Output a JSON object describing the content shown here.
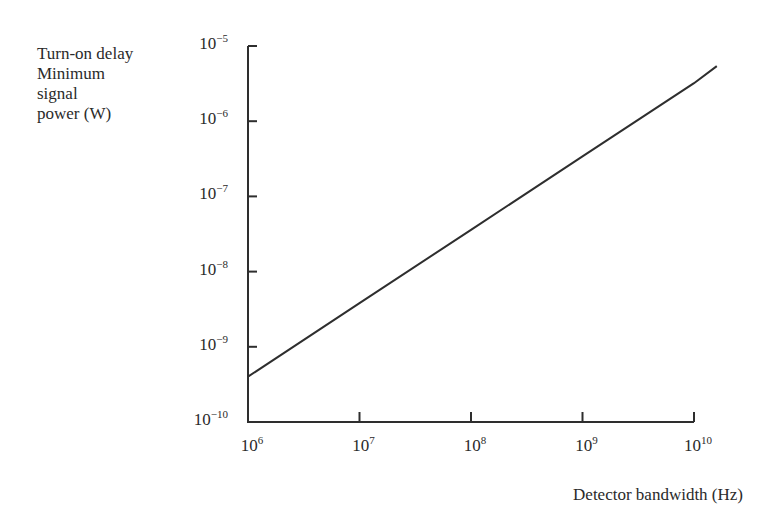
{
  "chart_data": {
    "type": "line",
    "title": "",
    "xlabel": "Detector bandwidth (Hz)",
    "ylabel_lines": [
      "Turn-on delay",
      "Minimum",
      "signal",
      "power (W)"
    ],
    "ylabel": "Turn-on delay Minimum signal power (W)",
    "x_scale": "log",
    "y_scale": "log",
    "xlim": [
      1000000.0,
      16000000000.0
    ],
    "ylim": [
      1e-10,
      1e-05
    ],
    "x_ticks": [
      {
        "base": "10",
        "exp": "6",
        "value": 1000000.0
      },
      {
        "base": "10",
        "exp": "7",
        "value": 10000000.0
      },
      {
        "base": "10",
        "exp": "8",
        "value": 100000000.0
      },
      {
        "base": "10",
        "exp": "9",
        "value": 1000000000.0
      },
      {
        "base": "10",
        "exp": "10",
        "value": 10000000000.0
      }
    ],
    "y_ticks": [
      {
        "base": "10",
        "exp": "−5",
        "value": 1e-05
      },
      {
        "base": "10",
        "exp": "−6",
        "value": 1e-06
      },
      {
        "base": "10",
        "exp": "−7",
        "value": 1e-07
      },
      {
        "base": "10",
        "exp": "−8",
        "value": 1e-08
      },
      {
        "base": "10",
        "exp": "−9",
        "value": 1e-09
      },
      {
        "base": "10",
        "exp": "−10",
        "value": 1e-10
      }
    ],
    "grid": false,
    "legend": null,
    "series": [
      {
        "name": "Minimum signal power",
        "x": [
          1000000.0,
          10000000.0,
          100000000.0,
          1000000000.0,
          10000000000.0,
          16000000000.0
        ],
        "y": [
          4e-10,
          3.8e-09,
          3.6e-08,
          3.4e-07,
          3.2e-06,
          5.4e-06
        ]
      }
    ]
  }
}
